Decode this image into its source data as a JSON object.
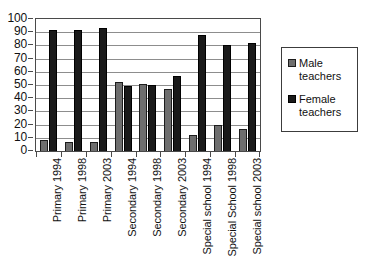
{
  "chart_data": {
    "type": "bar",
    "title": "",
    "subtitle": "",
    "xlabel": "",
    "ylabel": "",
    "ylim": [
      0,
      100
    ],
    "ytick_step": 10,
    "ytick_labels": [
      "100",
      "90",
      "80",
      "70",
      "60",
      "50",
      "40",
      "30",
      "20",
      "10",
      "0"
    ],
    "grid": true,
    "grid_axis": "y",
    "legend_position": "right",
    "categories": [
      "Primary 1994",
      "Primary 1998",
      "Primary 2003",
      "Secondary 1994",
      "Secondary 1998",
      "Secondary 2003",
      "Special school 1994",
      "Special School 1998",
      "Special school 2003"
    ],
    "series": [
      {
        "name": "Male teachers",
        "color": "#6e6e6e",
        "values": [
          8,
          7,
          7,
          52,
          51,
          47,
          12,
          20,
          17
        ]
      },
      {
        "name": "Female teachers",
        "color": "#1a1a1a",
        "values": [
          92,
          92,
          93,
          49,
          50,
          57,
          88,
          80,
          82
        ]
      }
    ]
  },
  "legend": {
    "entries": [
      {
        "label": "Male teachers",
        "swatch": "male-color-swatch"
      },
      {
        "label": "Female teachers",
        "swatch": "female-color-swatch"
      }
    ]
  }
}
